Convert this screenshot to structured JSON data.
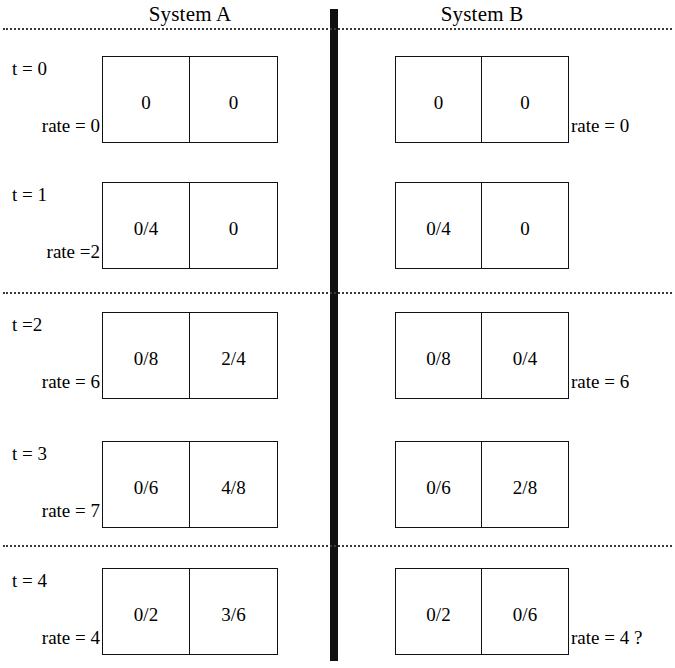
{
  "figure": {
    "background": "#ffffff",
    "ink": "#111111",
    "divider_color": "#111111",
    "rule_color": "#3a3a3a"
  },
  "columns": [
    {
      "id": "A",
      "title": "System A"
    },
    {
      "id": "B",
      "title": "System B"
    }
  ],
  "dotted_rules": [
    {
      "name": "rule-top",
      "y": 28
    },
    {
      "name": "rule-middle",
      "y": 292
    },
    {
      "name": "rule-lower",
      "y": 545
    }
  ],
  "rows": [
    {
      "time_label": "t = 0",
      "y": 56,
      "system_a": {
        "cells": [
          "0",
          "0"
        ],
        "rate_label": "rate = 0"
      },
      "system_b": {
        "cells": [
          "0",
          "0"
        ],
        "rate_label": "rate = 0"
      }
    },
    {
      "time_label": "t = 1",
      "y": 182,
      "system_a": {
        "cells": [
          "0/4",
          "0"
        ],
        "rate_label": "rate =2"
      },
      "system_b": {
        "cells": [
          "0/4",
          "0"
        ],
        "rate_label": ""
      }
    },
    {
      "time_label": "t =2",
      "y": 312,
      "system_a": {
        "cells": [
          "0/8",
          "2/4"
        ],
        "rate_label": "rate = 6"
      },
      "system_b": {
        "cells": [
          "0/8",
          "0/4"
        ],
        "rate_label": "rate = 6"
      }
    },
    {
      "time_label": "t = 3",
      "y": 441,
      "system_a": {
        "cells": [
          "0/6",
          "4/8"
        ],
        "rate_label": "rate = 7"
      },
      "system_b": {
        "cells": [
          "0/6",
          "2/8"
        ],
        "rate_label": ""
      }
    },
    {
      "time_label": "t = 4",
      "y": 568,
      "system_a": {
        "cells": [
          "0/2",
          "3/6"
        ],
        "rate_label": "rate = 4"
      },
      "system_b": {
        "cells": [
          "0/2",
          "0/6"
        ],
        "rate_label": "rate = 4 ?"
      }
    }
  ]
}
